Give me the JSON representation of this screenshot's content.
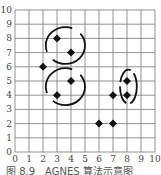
{
  "figure": {
    "caption": "图 8.9　AGNES 算法示意图",
    "x_ticks": [
      "0",
      "1",
      "2",
      "3",
      "4",
      "5",
      "6",
      "7",
      "8",
      "9",
      "10"
    ],
    "y_ticks": [
      "0",
      "1",
      "2",
      "3",
      "4",
      "5",
      "6",
      "7",
      "8",
      "9",
      "10"
    ],
    "points": [
      {
        "x": 2,
        "y": 6
      },
      {
        "x": 3,
        "y": 8
      },
      {
        "x": 4,
        "y": 7
      },
      {
        "x": 4,
        "y": 5
      },
      {
        "x": 3,
        "y": 4
      },
      {
        "x": 6,
        "y": 2
      },
      {
        "x": 7,
        "y": 2
      },
      {
        "x": 7,
        "y": 4
      },
      {
        "x": 8,
        "y": 4
      },
      {
        "x": 8,
        "y": 5
      }
    ],
    "clusters": [
      {
        "name": "upper-cluster",
        "cx": 3.6,
        "cy": 7.5,
        "rx": 1.4,
        "ry": 1.3
      },
      {
        "name": "lower-cluster",
        "cx": 3.6,
        "cy": 4.6,
        "rx": 1.4,
        "ry": 1.3
      },
      {
        "name": "right-cluster",
        "cx": 8.1,
        "cy": 4.6,
        "rx": 0.6,
        "ry": 1.2
      }
    ],
    "colors": {
      "grid": "#777777",
      "point": "#111111",
      "arc": "#111111",
      "text": "#444444"
    }
  }
}
